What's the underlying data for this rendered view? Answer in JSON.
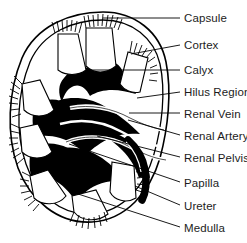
{
  "diagram": {
    "style": "black-and-white line art",
    "background_color": "#ffffff",
    "ink_color": "#000000",
    "label_text_color": "#1c1c1c"
  },
  "labels": [
    {
      "id": "capsule",
      "text": "Capsule",
      "x": 184,
      "y": 12,
      "leader_from_x": 180,
      "leader_from_y": 18,
      "leader_to_x": 103,
      "leader_to_y": 18
    },
    {
      "id": "cortex",
      "text": "Cortex",
      "x": 184,
      "y": 39,
      "leader_from_x": 180,
      "leader_from_y": 45,
      "leader_to_x": 131,
      "leader_to_y": 54
    },
    {
      "id": "calyx",
      "text": "Calyx",
      "x": 184,
      "y": 64,
      "leader_from_x": 180,
      "leader_from_y": 70,
      "leader_to_x": 86,
      "leader_to_y": 70
    },
    {
      "id": "hilus-region",
      "text": "Hilus Region",
      "x": 184,
      "y": 86,
      "leader_from_x": 180,
      "leader_from_y": 92,
      "leader_to_x": 137,
      "leader_to_y": 98
    },
    {
      "id": "renal-vein",
      "text": "Renal Vein",
      "x": 184,
      "y": 108,
      "leader_from_x": 180,
      "leader_from_y": 113,
      "leader_to_x": 129,
      "leader_to_y": 113
    },
    {
      "id": "renal-artery",
      "text": "Renal Artery",
      "x": 184,
      "y": 130,
      "leader_from_x": 180,
      "leader_from_y": 135,
      "leader_to_x": 128,
      "leader_to_y": 120
    },
    {
      "id": "renal-pelvis",
      "text": "Renal Pelvis",
      "x": 184,
      "y": 152,
      "leader_from_x": 180,
      "leader_from_y": 157,
      "leader_to_x": 97,
      "leader_to_y": 136
    },
    {
      "id": "papilla",
      "text": "Papilla",
      "x": 184,
      "y": 177,
      "leader_from_x": 180,
      "leader_from_y": 182,
      "leader_to_x": 69,
      "leader_to_y": 144
    },
    {
      "id": "ureter",
      "text": "Ureter",
      "x": 184,
      "y": 200,
      "leader_from_x": 180,
      "leader_from_y": 205,
      "leader_to_x": 135,
      "leader_to_y": 186
    },
    {
      "id": "medulla",
      "text": "Medulla",
      "x": 184,
      "y": 222,
      "leader_from_x": 180,
      "leader_from_y": 227,
      "leader_to_x": 75,
      "leader_to_y": 193
    }
  ]
}
